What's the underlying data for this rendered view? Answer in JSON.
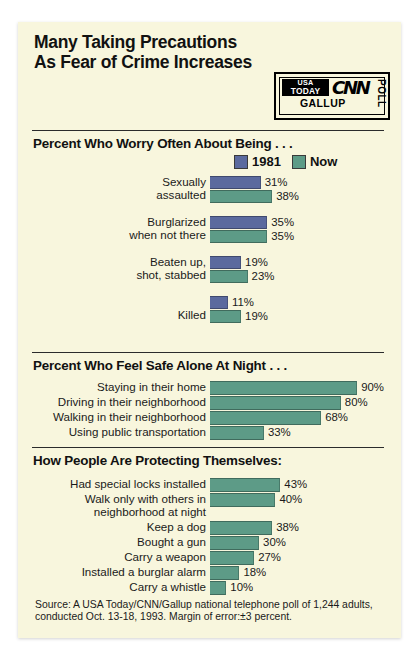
{
  "headline": "Many Taking Precautions\nAs Fear of Crime Increases",
  "intro": "A USA TODAY/CNN/Gallup Poll shows that more people are worried about being crime victims than were in a 1981 poll. People's crime fears and what they are doing about them:",
  "logo": {
    "usa": "USA",
    "today": "TODAY",
    "cnn": "CNN",
    "gallup": "GALLUP",
    "poll": "POLL"
  },
  "legend": [
    {
      "label": "1981",
      "color": "#5b6a9e"
    },
    {
      "label": "Now",
      "color": "#5d9b87"
    }
  ],
  "source": "Source: A USA Today/CNN/Gallup national telephone poll of 1,244 adults, conducted Oct. 13-18, 1993. Margin of error:±3 percent.",
  "chart_data": [
    {
      "type": "bar",
      "title": "Percent Who Worry Often About Being . . .",
      "orientation": "horizontal",
      "grouped": true,
      "categories": [
        "Sexually assaulted",
        "Burglarized when not there",
        "Beaten up, shot, stabbed",
        "Killed"
      ],
      "series": [
        {
          "name": "1981",
          "color": "#5b6a9e",
          "values": [
            31,
            35,
            19,
            11
          ]
        },
        {
          "name": "Now",
          "color": "#5d9b87",
          "values": [
            38,
            35,
            23,
            19
          ]
        }
      ],
      "value_suffix": "%",
      "xlim": [
        0,
        100
      ],
      "grid": false,
      "legend_position": "top-right"
    },
    {
      "type": "bar",
      "title": "Percent Who Feel Safe Alone At Night . . .",
      "orientation": "horizontal",
      "grouped": false,
      "categories": [
        "Staying in their home",
        "Driving in their neighborhood",
        "Walking in their neighborhood",
        "Using public transportation"
      ],
      "series": [
        {
          "name": "Now",
          "color": "#5d9b87",
          "values": [
            90,
            80,
            68,
            33
          ]
        }
      ],
      "value_suffix": "%",
      "xlim": [
        0,
        100
      ],
      "grid": false
    },
    {
      "type": "bar",
      "title": "How People Are Protecting Themselves:",
      "orientation": "horizontal",
      "grouped": false,
      "categories": [
        "Had special locks installed",
        "Walk only with others in neighborhood at night",
        "Keep a dog",
        "Bought a gun",
        "Carry a weapon",
        "Installed a burglar alarm",
        "Carry a whistle"
      ],
      "series": [
        {
          "name": "Now",
          "color": "#5d9b87",
          "values": [
            43,
            40,
            38,
            30,
            27,
            18,
            10
          ]
        }
      ],
      "value_suffix": "%",
      "xlim": [
        0,
        100
      ],
      "grid": false
    }
  ]
}
